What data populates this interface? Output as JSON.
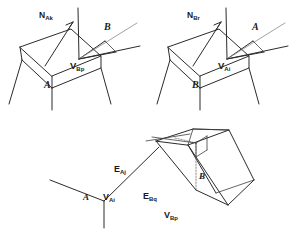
{
  "figure": {
    "background_color": "#ffffff",
    "line_color": "#2b2b2b",
    "light_line_color": "#8a8a8a"
  },
  "panels": [
    {
      "id": "panel-left",
      "description": "Vertex of B touching face of A, with face normal N_Ak",
      "labels": {
        "normal": {
          "base": "N",
          "sub": "Ak",
          "text": "N Ak"
        },
        "solid_far": {
          "text": "B"
        },
        "vertex": {
          "base": "V",
          "sub": "Bp",
          "text": "V Bp"
        },
        "solid_near": {
          "text": "A"
        }
      }
    },
    {
      "id": "panel-right",
      "description": "Vertex of A touching face of B, with face normal N_Br",
      "labels": {
        "normal": {
          "base": "N",
          "sub": "Br",
          "text": "N Br"
        },
        "solid_far": {
          "text": "A"
        },
        "vertex": {
          "base": "V",
          "sub": "Ai",
          "text": "V Ai"
        },
        "solid_near": {
          "text": "B"
        }
      }
    },
    {
      "id": "panel-bottom",
      "description": "Edge-edge contact between solid A and solid B",
      "labels": {
        "edge_a": {
          "base": "E",
          "sub": "Aj",
          "text": "E Aj"
        },
        "vertex_a": {
          "base": "V",
          "sub": "Ai",
          "text": "V Ai"
        },
        "edge_b": {
          "base": "E",
          "sub": "Bq",
          "text": "E Bq"
        },
        "vertex_b": {
          "base": "V",
          "sub": "Bp",
          "text": "V Bp"
        },
        "solid_a": {
          "text": "A"
        },
        "solid_b": {
          "text": "B"
        }
      }
    }
  ]
}
